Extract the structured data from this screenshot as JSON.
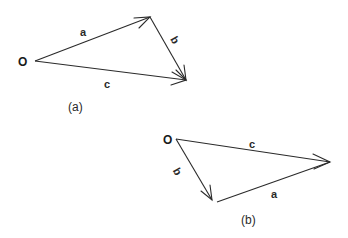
{
  "diagram_a": {
    "caption": "(a)",
    "origin_label": "O",
    "vectors": [
      {
        "name": "a",
        "label": "a"
      },
      {
        "name": "b",
        "label": "b"
      },
      {
        "name": "c",
        "label": "c"
      }
    ]
  },
  "diagram_b": {
    "caption": "(b)",
    "origin_label": "O",
    "vectors": [
      {
        "name": "b",
        "label": "b"
      },
      {
        "name": "a",
        "label": "a"
      },
      {
        "name": "c",
        "label": "c"
      }
    ]
  },
  "colors": {
    "ink": "#2a2a2a",
    "background": "#ffffff"
  }
}
